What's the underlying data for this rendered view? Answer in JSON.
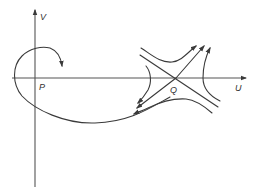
{
  "figure": {
    "axes": {
      "horizontal_label": "U",
      "vertical_label": "V"
    },
    "points": [
      {
        "name": "P",
        "label": "P",
        "role": "origin / focus"
      },
      {
        "name": "Q",
        "label": "Q",
        "role": "saddle point"
      }
    ],
    "colors": {
      "stroke": "#3a3a3a",
      "axis": "#555555",
      "background": "#ffffff"
    }
  }
}
